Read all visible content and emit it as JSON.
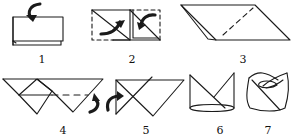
{
  "colors": {
    "line": "#1a1a1a",
    "background": "#ffffff"
  },
  "steps": [
    {
      "number": "1",
      "description": "Folded rectangle, fold top layer over",
      "icon": "curved-arrow-down"
    },
    {
      "number": "2",
      "description": "Fold corners in diagonally along dashed lines",
      "icon": "curved-arrows-inward"
    },
    {
      "number": "3",
      "description": "Parallelogram with dashed fold line"
    },
    {
      "number": "4",
      "description": "Inverted triangle with inner diamond and dashed fold",
      "icon": "curved-arrow-turn"
    },
    {
      "number": "5",
      "description": "Triangle flipped over",
      "icon": "curved-arrow-turn"
    },
    {
      "number": "6",
      "description": "Opened into crown shape with oval base"
    },
    {
      "number": "7",
      "description": "Finished napkin cup"
    }
  ]
}
